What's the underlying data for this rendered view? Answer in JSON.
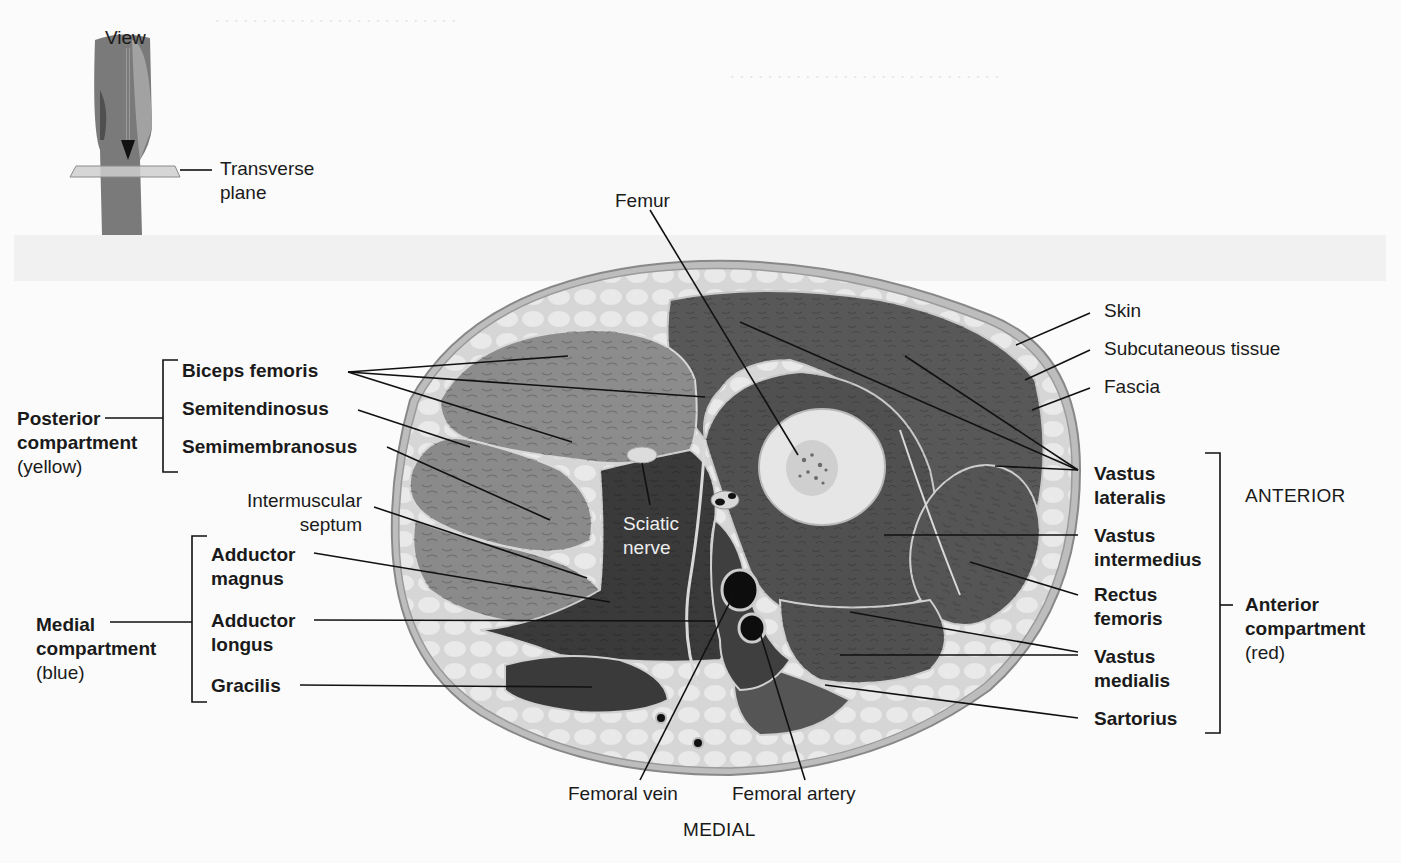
{
  "figure": {
    "inset": {
      "view_label": "View",
      "plane_label_line1": "Transverse",
      "plane_label_line2": "plane"
    },
    "orientation": {
      "anterior": "ANTERIOR",
      "medial": "MEDIAL"
    },
    "structures": {
      "femur": "Femur",
      "skin": "Skin",
      "subcutaneous_tissue": "Subcutaneous tissue",
      "fascia": "Fascia",
      "intermuscular_septum_line1": "Intermuscular",
      "intermuscular_septum_line2": "septum",
      "sciatic_nerve_line1": "Sciatic",
      "sciatic_nerve_line2": "nerve",
      "femoral_vein": "Femoral vein",
      "femoral_artery": "Femoral artery"
    },
    "compartments": {
      "posterior": {
        "name_line1": "Posterior",
        "name_line2": "compartment",
        "color_note": "(yellow)",
        "muscles": [
          "Biceps femoris",
          "Semitendinosus",
          "Semimembranosus"
        ]
      },
      "medial": {
        "name_line1": "Medial",
        "name_line2": "compartment",
        "color_note": "(blue)",
        "muscles": [
          {
            "line1": "Adductor",
            "line2": "magnus"
          },
          {
            "line1": "Adductor",
            "line2": "longus"
          },
          {
            "line1": "Gracilis",
            "line2": ""
          }
        ]
      },
      "anterior": {
        "name_line1": "Anterior",
        "name_line2": "compartment",
        "color_note": "(red)",
        "muscles": [
          {
            "line1": "Vastus",
            "line2": "lateralis"
          },
          {
            "line1": "Vastus",
            "line2": "intermedius"
          },
          {
            "line1": "Rectus",
            "line2": "femoris"
          },
          {
            "line1": "Vastus",
            "line2": "medialis"
          },
          {
            "line1": "Sartorius",
            "line2": ""
          }
        ]
      }
    },
    "colors": {
      "label_text": "#1a1a1a",
      "leader_line": "#111111",
      "skin_fat": "#d9d9d9",
      "posterior_muscle": "#8a8a8a",
      "medial_muscle": "#3e3e3e",
      "anterior_muscle": "#555555",
      "bone": "#e6e6e6",
      "vessel": "#0d0d0d"
    }
  }
}
